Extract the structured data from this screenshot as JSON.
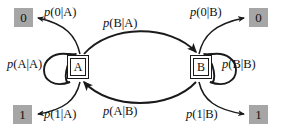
{
  "diagram": {
    "type": "state-transition-diagram",
    "title": "",
    "background_color": "#ffffff",
    "line_color": "#1a1a1a",
    "emission_box_color": "#a6a6a6",
    "text_color": "#111111",
    "states": [
      {
        "id": "A",
        "label": "A",
        "x": 78,
        "y": 67
      },
      {
        "id": "B",
        "label": "B",
        "x": 201,
        "y": 67
      }
    ],
    "emissions": [
      {
        "id": "emit-0-left",
        "label": "0",
        "from_state": "A",
        "x": 23,
        "y": 17
      },
      {
        "id": "emit-1-left",
        "label": "1",
        "from_state": "A",
        "x": 22,
        "y": 114
      },
      {
        "id": "emit-0-right",
        "label": "0",
        "from_state": "B",
        "x": 258,
        "y": 17
      },
      {
        "id": "emit-1-right",
        "label": "1",
        "from_state": "B",
        "x": 258,
        "y": 114
      }
    ],
    "labels": {
      "p_0_given_a": {
        "var": "p",
        "args": "(0|A)"
      },
      "p_1_given_a": {
        "var": "p",
        "args": "(1|A)"
      },
      "p_0_given_b": {
        "var": "p",
        "args": "(0|B)"
      },
      "p_1_given_b": {
        "var": "p",
        "args": "(1|B)"
      },
      "p_a_given_a": {
        "var": "p",
        "args": "(A|A)"
      },
      "p_b_given_b": {
        "var": "p",
        "args": "(B|B)"
      },
      "p_b_given_a": {
        "var": "p",
        "args": "(B|A)"
      },
      "p_a_given_b": {
        "var": "p",
        "args": "(A|B)"
      }
    },
    "transitions": [
      {
        "id": "a-to-b",
        "from": "A",
        "to": "B",
        "label_key": "p_b_given_a",
        "kind": "arc-top"
      },
      {
        "id": "b-to-a",
        "from": "B",
        "to": "A",
        "label_key": "p_a_given_b",
        "kind": "arc-bottom"
      },
      {
        "id": "a-to-a",
        "from": "A",
        "to": "A",
        "label_key": "p_a_given_a",
        "kind": "self-loop-left"
      },
      {
        "id": "b-to-b",
        "from": "B",
        "to": "B",
        "label_key": "p_b_given_b",
        "kind": "self-loop-right"
      }
    ],
    "emission_arrows": [
      {
        "id": "a-emit-0",
        "from": "A",
        "to": "emit-0-left",
        "label_key": "p_0_given_a"
      },
      {
        "id": "a-emit-1",
        "from": "A",
        "to": "emit-1-left",
        "label_key": "p_1_given_a"
      },
      {
        "id": "b-emit-0",
        "from": "B",
        "to": "emit-0-right",
        "label_key": "p_0_given_b"
      },
      {
        "id": "b-emit-1",
        "from": "B",
        "to": "emit-1-right",
        "label_key": "p_1_given_b"
      }
    ]
  }
}
